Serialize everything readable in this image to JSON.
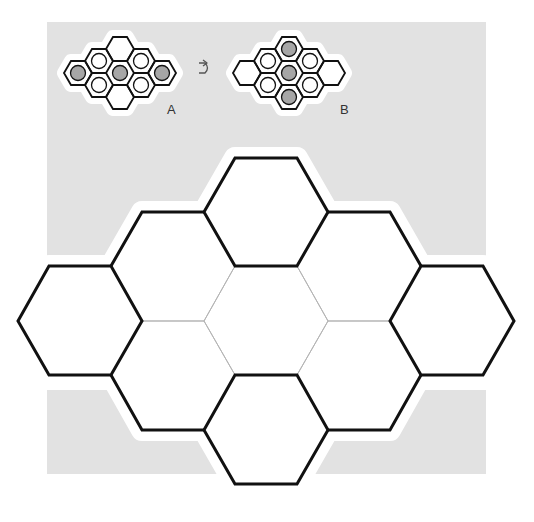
{
  "puzzle": {
    "example_a": {
      "label": "A",
      "center": [
        120,
        73
      ],
      "filled_cells": [
        "left",
        "center",
        "right"
      ],
      "ring_cells": [
        "upper-left",
        "upper-right",
        "lower-left",
        "lower-right"
      ],
      "empty_cells": [
        "top",
        "bottom"
      ]
    },
    "transform_icon": "rotate-arrow-icon",
    "example_b": {
      "label": "B",
      "center": [
        289,
        73
      ],
      "filled_cells": [
        "top",
        "center",
        "bottom"
      ],
      "ring_cells": [
        "upper-left",
        "upper-right",
        "lower-left",
        "lower-right"
      ],
      "empty_cells": [
        "left",
        "right"
      ]
    },
    "board": {
      "cell_count": 9,
      "cells": [
        "top",
        "upper-left",
        "upper-right",
        "left",
        "center",
        "right",
        "lower-left",
        "lower-right",
        "bottom"
      ]
    }
  },
  "colors": {
    "panel_bg": "#e2e2e2",
    "halo": "#ffffff",
    "stroke": "#111111",
    "thin_stroke": "#b5b5b5",
    "filled_circle": "#a6a6a6"
  }
}
